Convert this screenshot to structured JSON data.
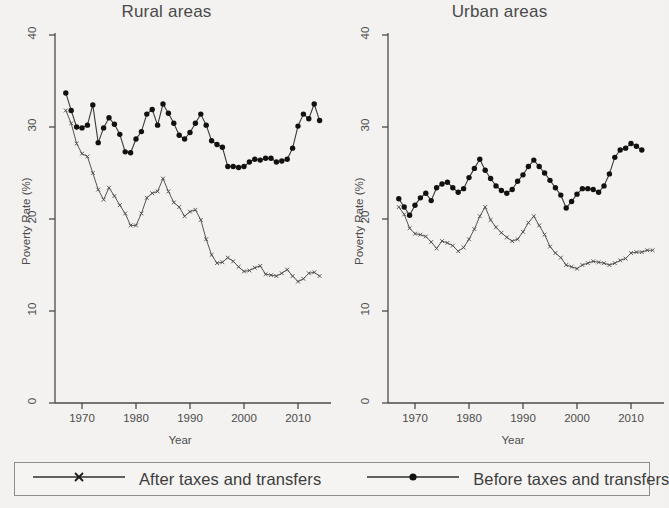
{
  "figure": {
    "background_color": "#f3f2f0",
    "line_color": "#3a3a3a",
    "marker_color": "#111111"
  },
  "panels": [
    {
      "title": "Rural areas"
    },
    {
      "title": "Urban areas"
    }
  ],
  "legend": {
    "entries": [
      {
        "label": "After taxes and transfers",
        "marker": "cross-marker",
        "key_name": "legend-key-after"
      },
      {
        "label": "Before taxes and transfers",
        "marker": "filled-circle-marker",
        "key_name": "legend-key-before"
      }
    ]
  },
  "chart_data": [
    {
      "type": "line",
      "title": "Rural areas",
      "xlabel": "Year",
      "ylabel": "Poverty Rate (%)",
      "xlim": [
        1965,
        2015
      ],
      "ylim": [
        0,
        40
      ],
      "xticks": [
        1970,
        1980,
        1990,
        2000,
        2010
      ],
      "yticks": [
        0,
        10,
        20,
        30,
        40
      ],
      "grid": false,
      "legend_position": "bottom-shared",
      "x": [
        1967,
        1968,
        1969,
        1970,
        1971,
        1972,
        1973,
        1974,
        1975,
        1976,
        1977,
        1978,
        1979,
        1980,
        1981,
        1982,
        1983,
        1984,
        1985,
        1986,
        1987,
        1988,
        1989,
        1990,
        1991,
        1992,
        1993,
        1994,
        1995,
        1996,
        1997,
        1998,
        1999,
        2000,
        2001,
        2002,
        2003,
        2004,
        2005,
        2006,
        2007,
        2008,
        2009,
        2010,
        2011,
        2012,
        2013,
        2014
      ],
      "series": [
        {
          "name": "Before taxes and transfers",
          "marker": "filled-circle-marker",
          "values": [
            33.7,
            31.8,
            30.0,
            29.9,
            30.2,
            32.4,
            28.3,
            29.9,
            31.0,
            30.3,
            29.2,
            27.3,
            27.2,
            28.7,
            29.5,
            31.4,
            31.9,
            30.2,
            32.5,
            31.5,
            30.4,
            29.1,
            28.7,
            29.4,
            30.4,
            31.4,
            30.2,
            28.5,
            28.1,
            27.8,
            25.7,
            25.7,
            25.6,
            25.7,
            26.2,
            26.5,
            26.4,
            26.6,
            26.6,
            26.2,
            26.3,
            26.5,
            27.7,
            30.1,
            31.4,
            30.9,
            32.5,
            30.7
          ]
        },
        {
          "name": "After taxes and transfers",
          "marker": "cross-marker",
          "values": [
            31.8,
            30.4,
            28.2,
            27.1,
            26.8,
            25.0,
            23.2,
            22.1,
            23.4,
            22.5,
            21.5,
            20.6,
            19.3,
            19.3,
            20.6,
            22.3,
            22.8,
            23.0,
            24.4,
            23.0,
            21.8,
            21.3,
            20.3,
            20.8,
            21.0,
            19.9,
            17.8,
            16.1,
            15.2,
            15.3,
            15.8,
            15.4,
            14.8,
            14.3,
            14.4,
            14.7,
            14.9,
            14.0,
            13.9,
            13.8,
            14.1,
            14.5,
            13.8,
            13.2,
            13.5,
            14.1,
            14.2,
            13.8
          ]
        }
      ]
    },
    {
      "type": "line",
      "title": "Urban areas",
      "xlabel": "Year",
      "ylabel": "Poverty Rate (%)",
      "xlim": [
        1965,
        2015
      ],
      "ylim": [
        0,
        40
      ],
      "xticks": [
        1970,
        1980,
        1990,
        2000,
        2010
      ],
      "yticks": [
        0,
        10,
        20,
        30,
        40
      ],
      "grid": false,
      "legend_position": "bottom-shared",
      "x": [
        1967,
        1968,
        1969,
        1970,
        1971,
        1972,
        1973,
        1974,
        1975,
        1976,
        1977,
        1978,
        1979,
        1980,
        1981,
        1982,
        1983,
        1984,
        1985,
        1986,
        1987,
        1988,
        1989,
        1990,
        1991,
        1992,
        1993,
        1994,
        1995,
        1996,
        1997,
        1998,
        1999,
        2000,
        2001,
        2002,
        2003,
        2004,
        2005,
        2006,
        2007,
        2008,
        2009,
        2010,
        2011,
        2012,
        2013,
        2014
      ],
      "series": [
        {
          "name": "Before taxes and transfers",
          "marker": "filled-circle-marker",
          "values": [
            22.2,
            21.3,
            20.4,
            21.5,
            22.3,
            22.8,
            22.0,
            23.4,
            23.8,
            24.0,
            23.4,
            22.9,
            23.3,
            24.5,
            25.5,
            26.5,
            25.3,
            24.4,
            23.6,
            23.1,
            22.8,
            23.2,
            24.1,
            24.8,
            25.7,
            26.4,
            25.7,
            25.0,
            24.2,
            23.4,
            22.6,
            21.2,
            21.9,
            22.7,
            23.3,
            23.3,
            23.2,
            22.9,
            23.6,
            24.9,
            26.7,
            27.5,
            27.7,
            28.2,
            27.9,
            27.5
          ]
        },
        {
          "name": "After taxes and transfers",
          "marker": "cross-marker",
          "values": [
            21.3,
            20.5,
            19.0,
            18.4,
            18.3,
            18.1,
            17.5,
            16.8,
            17.6,
            17.4,
            17.1,
            16.5,
            16.9,
            17.8,
            18.9,
            20.3,
            21.3,
            19.9,
            19.1,
            18.5,
            18.0,
            17.6,
            17.8,
            18.6,
            19.6,
            20.3,
            19.3,
            18.3,
            17.0,
            16.3,
            15.8,
            15.0,
            14.8,
            14.6,
            15.0,
            15.2,
            15.4,
            15.3,
            15.2,
            15.0,
            15.2,
            15.5,
            15.7,
            16.3,
            16.4,
            16.4,
            16.6,
            16.6
          ]
        }
      ]
    }
  ]
}
